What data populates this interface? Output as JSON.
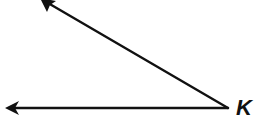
{
  "diagram": {
    "type": "angle",
    "vertex_label": "K",
    "vertex": {
      "x": 228,
      "y": 108
    },
    "rays": [
      {
        "name": "upper-ray",
        "end": {
          "x": 40,
          "y": -2
        },
        "arrowhead": true
      },
      {
        "name": "lower-ray",
        "end": {
          "x": 5,
          "y": 108
        },
        "arrowhead": true
      }
    ],
    "stroke_color": "#111111"
  }
}
